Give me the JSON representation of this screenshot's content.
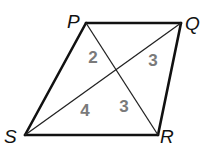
{
  "figure": {
    "shape": "quadrilateral",
    "vertices": [
      "P",
      "Q",
      "R",
      "S"
    ],
    "sides": [
      [
        "P",
        "Q"
      ],
      [
        "Q",
        "R"
      ],
      [
        "R",
        "S"
      ],
      [
        "S",
        "P"
      ]
    ],
    "diagonals": [
      [
        "P",
        "R"
      ],
      [
        "S",
        "Q"
      ]
    ]
  },
  "vertex_labels": {
    "P": "P",
    "Q": "Q",
    "R": "R",
    "S": "S"
  },
  "segment_labels": [
    {
      "segment": "P-center",
      "text": "2"
    },
    {
      "segment": "Q-center",
      "text": "3"
    },
    {
      "segment": "S-center",
      "text": "4"
    },
    {
      "segment": "R-center",
      "text": "3"
    }
  ],
  "colors": {
    "line": "#111111",
    "segment_label": "#7a7a7a"
  }
}
